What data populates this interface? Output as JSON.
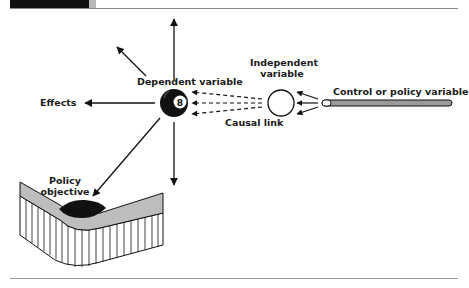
{
  "header": {
    "title_partial": "...ategy ... policy ..."
  },
  "diagram": {
    "labels": {
      "dependent_variable": "Dependent variable",
      "effects": "Effects",
      "independent_variable_line1": "Independent",
      "independent_variable_line2": "variable",
      "control_variable": "Control or policy variable",
      "causal_link": "Causal link",
      "policy_objective_line1": "Policy",
      "policy_objective_line2": "objective",
      "ball_number": "8"
    },
    "colors": {
      "ink": "#111111",
      "surface_gray": "#bdbdbd",
      "rod_gray": "#9a9a9a"
    }
  }
}
